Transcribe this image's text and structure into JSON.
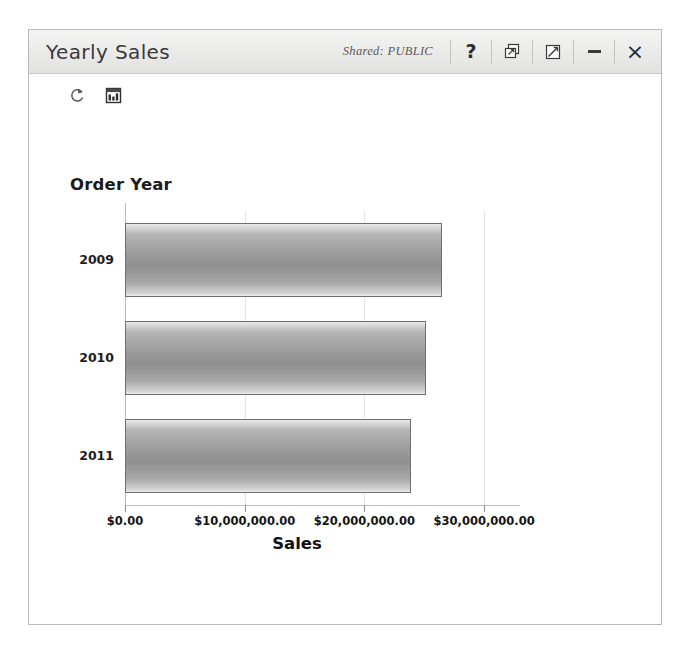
{
  "window": {
    "title": "Yearly Sales",
    "shared_label": "Shared: PUBLIC",
    "buttons": {
      "help": "?",
      "copy": "copy-windows-icon",
      "resize": "resize-icon",
      "minimize": "_",
      "close": "×"
    }
  },
  "toolbar": {
    "items": [
      {
        "name": "refresh-icon",
        "tooltip": "Refresh"
      },
      {
        "name": "chart-type-icon",
        "tooltip": "Chart"
      }
    ]
  },
  "chart_data": {
    "type": "bar",
    "orientation": "horizontal",
    "title": "",
    "xlabel": "Sales",
    "ylabel": "Order Year",
    "categories": [
      "2009",
      "2010",
      "2011"
    ],
    "values": [
      26500000,
      25150000,
      23900000
    ],
    "xlim": [
      0,
      33000000
    ],
    "xticks": [
      0,
      10000000,
      20000000,
      30000000
    ],
    "xticklabels": [
      "$0.00",
      "$10,000,000.00",
      "$20,000,000.00",
      "$30,000,000.00"
    ],
    "grid": true,
    "legend": false,
    "bar_color": "#9a9a9a",
    "bar_border_color": "#6f6f6f"
  },
  "colors": {
    "titlebar_bg": "#ececeb",
    "window_border": "#b9b9b9",
    "text": "#1b1b1b",
    "gridline": "#e4e4e4"
  }
}
